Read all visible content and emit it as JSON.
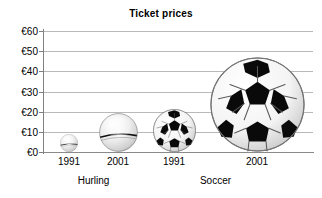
{
  "chart_data": {
    "type": "bar",
    "title": "Ticket prices",
    "xlabel": "",
    "ylabel": "",
    "ylim": [
      0,
      60
    ],
    "ytick_values": [
      0,
      10,
      20,
      30,
      40,
      50,
      60
    ],
    "ytick_labels": [
      "€0",
      "€10",
      "€20",
      "€30",
      "€40",
      "€50",
      "€60"
    ],
    "grid": true,
    "legend": "none",
    "currency_symbol": "€",
    "categories": [
      "1991",
      "2001",
      "1991",
      "2001"
    ],
    "groups": [
      {
        "name": "Hurling",
        "categories": [
          "1991",
          "2001"
        ],
        "values": [
          9,
          19
        ]
      },
      {
        "name": "Soccer",
        "categories": [
          "1991",
          "2001"
        ],
        "values": [
          21,
          47
        ]
      }
    ],
    "values": [
      9,
      19,
      21,
      47
    ],
    "points": [
      {
        "group": "Hurling",
        "year": "1991",
        "value": 9,
        "marker": "sliotar-ball",
        "cx": 69,
        "diameter": 18
      },
      {
        "group": "Hurling",
        "year": "2001",
        "value": 19,
        "marker": "sliotar-ball",
        "cx": 118,
        "diameter": 39
      },
      {
        "group": "Soccer",
        "year": "1991",
        "value": 21,
        "marker": "soccer-ball",
        "cx": 174,
        "diameter": 43
      },
      {
        "group": "Soccer",
        "year": "2001",
        "value": 47,
        "marker": "soccer-ball",
        "cx": 257,
        "diameter": 95
      }
    ],
    "colors": {
      "background": "#ffffff",
      "gridline": "#b9b9b9",
      "axis": "#808080",
      "text": "#000000",
      "ball_light": "#f2f2f2",
      "ball_dark": "#000000"
    }
  }
}
